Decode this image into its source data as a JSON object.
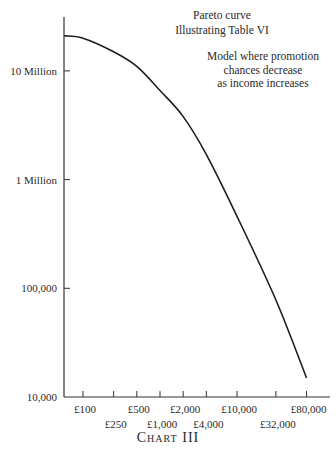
{
  "chart_data": {
    "type": "line",
    "title": "Pareto curve",
    "subtitle": "Illustrating Table VI",
    "annotation": [
      "Model where promotion",
      "chances decrease",
      "as income increases"
    ],
    "caption": "Chart III",
    "xlabel": "Income (£, log scale)",
    "ylabel": "Number of persons (log scale)",
    "x_scale": "log",
    "y_scale": "log",
    "xlim": [
      57,
      300000
    ],
    "ylim": [
      10000,
      30000000
    ],
    "x_ticks": [
      {
        "value": 100,
        "label": "£100",
        "row": 0
      },
      {
        "value": 250,
        "label": "£250",
        "row": 1
      },
      {
        "value": 500,
        "label": "£500",
        "row": 0
      },
      {
        "value": 1000,
        "label": "£1,000",
        "row": 1
      },
      {
        "value": 2000,
        "label": "£2,000",
        "row": 0
      },
      {
        "value": 4000,
        "label": "£4,000",
        "row": 1
      },
      {
        "value": 10000,
        "label": "£10,000",
        "row": 0
      },
      {
        "value": 32000,
        "label": "£32,000",
        "row": 1
      },
      {
        "value": 80000,
        "label": "£80,000",
        "row": 0
      }
    ],
    "y_ticks": [
      {
        "value": 10000,
        "label": "10,000"
      },
      {
        "value": 100000,
        "label": "100,000"
      },
      {
        "value": 1000000,
        "label": "1 Million"
      },
      {
        "value": 10000000,
        "label": "10 Million"
      }
    ],
    "grid": false,
    "legend": null,
    "series": [
      {
        "name": "Pareto curve",
        "x": [
          57,
          100,
          250,
          500,
          1000,
          2000,
          4000,
          10000,
          32000,
          80000
        ],
        "values": [
          21000000,
          20000000,
          15000000,
          11000000,
          6600000,
          3800000,
          1700000,
          460000,
          78000,
          15000
        ]
      }
    ]
  },
  "labels": {
    "title": "Pareto curve",
    "subtitle_prefix": "Illustrating Table ",
    "subtitle_numeral": "VI",
    "note_line1": "Model where promotion",
    "note_line2": "chances decrease",
    "note_line3": "as income increases",
    "caption": "Chart III"
  }
}
